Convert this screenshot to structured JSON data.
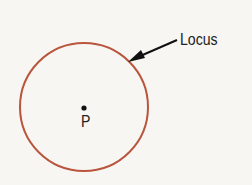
{
  "diagram": {
    "circle": {
      "cx": 84,
      "cy": 107,
      "r": 64,
      "stroke": "#b9553c"
    },
    "center_point": {
      "label": "P",
      "x": 84,
      "y": 108
    },
    "callout": {
      "label": "Locus",
      "arrow_from": [
        177,
        40
      ],
      "arrow_to": [
        129,
        61
      ]
    }
  }
}
